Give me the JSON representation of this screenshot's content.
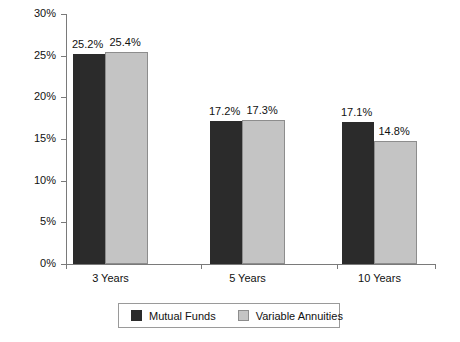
{
  "chart_data": {
    "type": "bar",
    "title": "",
    "xlabel": "",
    "ylabel": "",
    "categories": [
      "3 Years",
      "5 Years",
      "10 Years"
    ],
    "series": [
      {
        "name": "Mutual Funds",
        "color": "#2b2b2b",
        "values": [
          25.2,
          17.2,
          17.1
        ],
        "labels": [
          "25.2%",
          "17.2%",
          "17.1%"
        ]
      },
      {
        "name": "Variable Annuities",
        "color": "#c4c4c4",
        "values": [
          25.4,
          17.3,
          14.8
        ],
        "labels": [
          "25.4%",
          "17.3%",
          "14.8%"
        ]
      }
    ],
    "ylim": [
      0,
      30
    ],
    "yticks": [
      0,
      5,
      10,
      15,
      20,
      25,
      30
    ],
    "ytick_labels": [
      "0%",
      "5%",
      "10%",
      "15%",
      "20%",
      "25%",
      "30%"
    ],
    "grid": false,
    "legend_position": "bottom"
  },
  "legend": {
    "entries": [
      {
        "label": "Mutual Funds",
        "swatch": "dark"
      },
      {
        "label": "Variable Annuities",
        "swatch": "light"
      }
    ]
  }
}
